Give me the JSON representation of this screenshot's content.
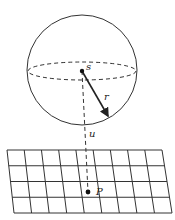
{
  "diagram": {
    "labels": {
      "center": "s",
      "radius": "r",
      "distance": "u",
      "point": "P"
    },
    "grid": {
      "columns": 9,
      "rows": 4
    },
    "colors": {
      "line": "#333333",
      "background": "#ffffff"
    }
  }
}
